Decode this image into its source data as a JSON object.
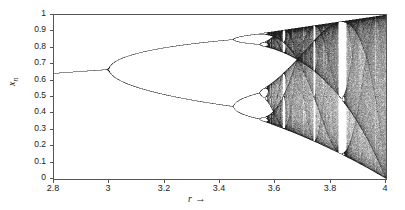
{
  "figure": {
    "background_color": "#ffffff",
    "axis_color": "#555555",
    "point_color": "#1a1a1a",
    "curve_color": "#555555"
  },
  "axes": {
    "x_label": "r",
    "x_label_arrow": "→",
    "y_label_base": "x",
    "y_label_sub": "n",
    "x_ticks": [
      "2.8",
      "3",
      "3.2",
      "3.4",
      "3.6",
      "3.8",
      "4"
    ],
    "x_tick_values": [
      2.8,
      3.0,
      3.2,
      3.4,
      3.6,
      3.8,
      4.0
    ],
    "y_ticks": [
      "0",
      "0.1",
      "0.2",
      "0.3",
      "0.4",
      "0.5",
      "0.6",
      "0.7",
      "0.8",
      "0.9",
      "1"
    ],
    "y_tick_values": [
      0,
      0.1,
      0.2,
      0.3,
      0.4,
      0.5,
      0.6,
      0.7,
      0.8,
      0.9,
      1.0
    ]
  },
  "chart_data": {
    "type": "scatter",
    "title": "",
    "subtitle": "",
    "xlabel": "r",
    "ylabel": "x_n",
    "xlim": [
      2.8,
      4.0
    ],
    "ylim": [
      0.0,
      1.0
    ],
    "grid": false,
    "legend": null,
    "equation": "x_{n+1} = r x_n (1 - x_n)",
    "map": "logistic",
    "generation": {
      "r_min": 2.8,
      "r_max": 4.0,
      "r_steps": 1400,
      "x0": 0.35,
      "transient_iterations": 320,
      "plot_iterations": 220
    },
    "annotations": [
      {
        "label": "fixed point branch",
        "r_range": [
          2.8,
          3.0
        ],
        "x_at_r_min": 0.643,
        "x_at_r_max": 0.667
      },
      {
        "label": "first period-doubling (period 1 -> 2)",
        "r": 3.0
      },
      {
        "label": "period 2 -> 4",
        "r": 3.449
      },
      {
        "label": "period 4 -> 8",
        "r": 3.544
      },
      {
        "label": "onset of chaos (Feigenbaum point)",
        "r": 3.5699
      },
      {
        "label": "period-3 window",
        "r_range": [
          3.828,
          3.857
        ]
      },
      {
        "label": "upper attractor boundary at r=4",
        "x": 1.0
      },
      {
        "label": "lower attractor boundary at r=4",
        "x": 0.0
      }
    ],
    "series": [
      {
        "name": "attractor",
        "note": "values computed from the logistic map; representative upper/lower envelope samples listed below",
        "envelope_r": [
          2.8,
          2.9,
          3.0,
          3.1,
          3.2,
          3.3,
          3.4,
          3.5,
          3.6,
          3.7,
          3.8,
          3.9,
          4.0
        ],
        "envelope_upper": [
          0.643,
          0.655,
          0.667,
          0.765,
          0.799,
          0.824,
          0.843,
          0.875,
          0.892,
          0.925,
          0.95,
          0.975,
          1.0
        ],
        "envelope_lower": [
          0.643,
          0.655,
          0.667,
          0.558,
          0.513,
          0.479,
          0.452,
          0.383,
          0.327,
          0.257,
          0.19,
          0.113,
          0.0
        ]
      }
    ]
  }
}
